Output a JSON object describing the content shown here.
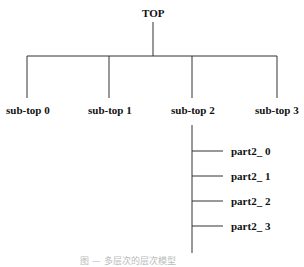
{
  "diagram": {
    "root": {
      "label": "TOP"
    },
    "children": [
      {
        "label": "sub-top 0"
      },
      {
        "label": "sub-top 1"
      },
      {
        "label": "sub-top 2",
        "children": [
          {
            "label": "part2_ 0"
          },
          {
            "label": "part2_ 1"
          },
          {
            "label": "part2_ 2"
          },
          {
            "label": "part2_ 3"
          }
        ]
      },
      {
        "label": "sub-top 3"
      }
    ],
    "caption": "图 — 多层次的层次模型",
    "line_color": "#333333"
  }
}
